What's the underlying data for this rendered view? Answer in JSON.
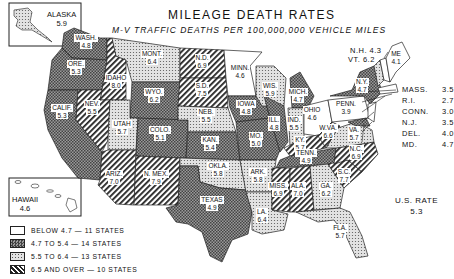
{
  "title": "MILEAGE DEATH RATES",
  "subtitle": "M-V TRAFFIC DEATHS PER 100,000,000 VEHICLE MILES",
  "us_rate": {
    "label": "U.S. RATE",
    "value": "5.3"
  },
  "legend": [
    {
      "pattern": "blank",
      "label": "BELOW 4.7 — 11 STATES"
    },
    {
      "pattern": "crosshatch",
      "label": "4.7 TO 5.4 — 14 STATES"
    },
    {
      "pattern": "dots",
      "label": "5.5 TO 6.4 — 13 STATES"
    },
    {
      "pattern": "diagonal",
      "label": "6.5 AND OVER — 10 STATES"
    }
  ],
  "insets": {
    "alaska": {
      "name": "ALASKA",
      "value": "5.9"
    },
    "hawaii": {
      "name": "HAWAII",
      "value": "4.6"
    }
  },
  "states": {
    "wash": {
      "name": "WASH.",
      "value": "4.8"
    },
    "ore": {
      "name": "ORE.",
      "value": "5.3"
    },
    "calif": {
      "name": "CALIF.",
      "value": "5.3"
    },
    "idaho": {
      "name": "IDAHO",
      "value": "8.0"
    },
    "nev": {
      "name": "NEV.",
      "value": "5.5"
    },
    "mont": {
      "name": "MONT.",
      "value": "6.4"
    },
    "wyo": {
      "name": "WYO.",
      "value": "6.2"
    },
    "utah": {
      "name": "UTAH",
      "value": "5.7"
    },
    "colo": {
      "name": "COLO.",
      "value": "5.1"
    },
    "ariz": {
      "name": "ARIZ.",
      "value": "7.0"
    },
    "nmex": {
      "name": "N. MEX.",
      "value": "7.9"
    },
    "nd": {
      "name": "N.D.",
      "value": "6.9"
    },
    "sd": {
      "name": "S.D.",
      "value": "7.5"
    },
    "neb": {
      "name": "NEB.",
      "value": "5.5"
    },
    "kan": {
      "name": "KAN.",
      "value": "5.4"
    },
    "okla": {
      "name": "OKLA.",
      "value": "5.8"
    },
    "texas": {
      "name": "TEXAS",
      "value": "4.9"
    },
    "minn": {
      "name": "MINN.",
      "value": "4.6"
    },
    "iowa": {
      "name": "IOWA",
      "value": "4.8"
    },
    "mo": {
      "name": "MO.",
      "value": "5.0"
    },
    "ark": {
      "name": "ARK.",
      "value": "5.8"
    },
    "la": {
      "name": "LA.",
      "value": "6.4"
    },
    "wis": {
      "name": "WIS.",
      "value": "5.9"
    },
    "ill": {
      "name": "ILL.",
      "value": "4.8"
    },
    "mich": {
      "name": "MICH.",
      "value": "4.7"
    },
    "ind": {
      "name": "IND.",
      "value": "5.5"
    },
    "ohio": {
      "name": "OHIO",
      "value": "4.6"
    },
    "ky": {
      "name": "KY.",
      "value": "5.7"
    },
    "tenn": {
      "name": "TENN.",
      "value": "4.9"
    },
    "miss": {
      "name": "MISS.",
      "value": "6.9"
    },
    "ala": {
      "name": "ALA.",
      "value": "7.0"
    },
    "ga": {
      "name": "GA.",
      "value": "6.2"
    },
    "fla": {
      "name": "FLA.",
      "value": "5.7"
    },
    "sc": {
      "name": "S.C.",
      "value": "7.7"
    },
    "nc": {
      "name": "N.C.",
      "value": "6.9"
    },
    "va": {
      "name": "VA.",
      "value": "5.7"
    },
    "wva": {
      "name": "W.VA.",
      "value": "6.6"
    },
    "penn": {
      "name": "PENN.",
      "value": "3.9"
    },
    "ny": {
      "name": "N.Y.",
      "value": "4.7"
    },
    "me": {
      "name": "ME",
      "value": "4.1"
    },
    "nh": {
      "name": "N.H.",
      "value": "4.3"
    },
    "vt": {
      "name": "VT.",
      "value": "6.2"
    }
  },
  "northeast_list": [
    {
      "name": "MASS.",
      "value": "3.5"
    },
    {
      "name": "R.I.",
      "value": "2.7"
    },
    {
      "name": "CONN.",
      "value": "3.0"
    },
    {
      "name": "N.J.",
      "value": "3.5"
    },
    {
      "name": "DEL.",
      "value": "4.0"
    },
    {
      "name": "MD.",
      "value": "4.7"
    }
  ],
  "nh_vt_labels": {
    "nh": "N.H. 4.3",
    "vt": "VT. 6.2"
  },
  "labels": {
    "wash": [
      "WASH.",
      "4.8"
    ]
  },
  "chart_data": {
    "type": "choropleth",
    "title": "MILEAGE DEATH RATES",
    "subtitle": "M-V TRAFFIC DEATHS PER 100,000,000 VEHICLE MILES",
    "us_rate": 5.3,
    "bins": [
      {
        "label": "BELOW 4.7",
        "count": 11
      },
      {
        "label": "4.7 TO 5.4",
        "count": 14
      },
      {
        "label": "5.5 TO 6.4",
        "count": 13
      },
      {
        "label": "6.5 AND OVER",
        "count": 10
      }
    ],
    "values": {
      "ALASKA": 5.9,
      "HAWAII": 4.6,
      "WASH.": 4.8,
      "ORE.": 5.3,
      "CALIF.": 5.3,
      "IDAHO": 8.0,
      "NEV.": 5.5,
      "MONT.": 6.4,
      "WYO.": 6.2,
      "UTAH": 5.7,
      "COLO.": 5.1,
      "ARIZ.": 7.0,
      "N. MEX.": 7.9,
      "N.D.": 6.9,
      "S.D.": 7.5,
      "NEB.": 5.5,
      "KAN.": 5.4,
      "OKLA.": 5.8,
      "TEXAS": 4.9,
      "MINN.": 4.6,
      "IOWA": 4.8,
      "MO.": 5.0,
      "ARK.": 5.8,
      "LA.": 6.4,
      "WIS.": 5.9,
      "ILL.": 4.8,
      "MICH.": 4.7,
      "IND.": 5.5,
      "OHIO": 4.6,
      "KY.": 5.7,
      "TENN.": 4.9,
      "MISS.": 6.9,
      "ALA.": 7.0,
      "GA.": 6.2,
      "FLA.": 5.7,
      "S.C.": 7.7,
      "N.C.": 6.9,
      "VA.": 5.7,
      "W.VA.": 6.6,
      "PENN.": 3.9,
      "N.Y.": 4.7,
      "ME": 4.1,
      "N.H.": 4.3,
      "VT.": 6.2,
      "MASS.": 3.5,
      "R.I.": 2.7,
      "CONN.": 3.0,
      "N.J.": 3.5,
      "DEL.": 4.0,
      "MD.": 4.7
    }
  }
}
